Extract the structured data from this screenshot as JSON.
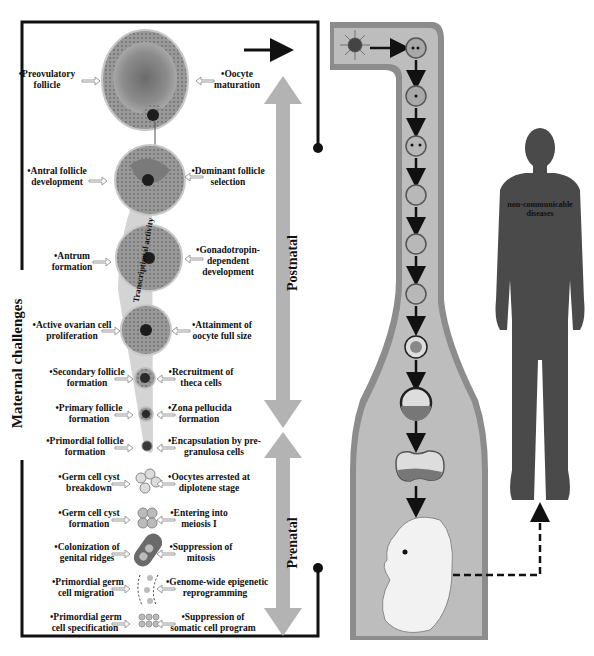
{
  "side_labels": {
    "maternal_challenges": "Maternal challenges",
    "postnatal": "Postnatal",
    "prenatal": "Prenatal",
    "transcriptional_activity": "Transcriptional activity",
    "human_figure_text_line1": "non-communicable",
    "human_figure_text_line2": "diseases"
  },
  "stages": [
    {
      "left_line1": "•Preovulatory",
      "left_line2": "follicle",
      "right_line1": "•Oocyte",
      "right_line2": "maturation",
      "right_line3": ""
    },
    {
      "left_line1": "•Antral follicle",
      "left_line2": "development",
      "right_line1": "•Dominant follicle",
      "right_line2": "selection",
      "right_line3": ""
    },
    {
      "left_line1": "•Antrum",
      "left_line2": "formation",
      "right_line1": "•Gonadotropin-",
      "right_line2": "dependent",
      "right_line3": "development"
    },
    {
      "left_line1": "•Active ovarian cell",
      "left_line2": "proliferation",
      "right_line1": "•Attainment of",
      "right_line2": "oocyte full size",
      "right_line3": ""
    },
    {
      "left_line1": "•Secondary follicle",
      "left_line2": "formation",
      "right_line1": "•Recruitment of",
      "right_line2": "theca cells",
      "right_line3": ""
    },
    {
      "left_line1": "•Primary follicle",
      "left_line2": "formation",
      "right_line1": "•Zona pellucida",
      "right_line2": "formation",
      "right_line3": ""
    },
    {
      "left_line1": "•Primordial follicle",
      "left_line2": "formation",
      "right_line1": "•Encapsulation by pre-",
      "right_line2": "granulosa cells",
      "right_line3": ""
    },
    {
      "left_line1": "•Germ cell cyst",
      "left_line2": "breakdown",
      "right_line1": "•Oocytes arrested at",
      "right_line2": "diplotene stage",
      "right_line3": ""
    },
    {
      "left_line1": "•Germ cell cyst",
      "left_line2": "formation",
      "right_line1": "•Entering into",
      "right_line2": "meiosis I",
      "right_line3": ""
    },
    {
      "left_line1": "•Colonization of",
      "left_line2": "genital ridges",
      "right_line1": "•Suppression of",
      "right_line2": "mitosis",
      "right_line3": ""
    },
    {
      "left_line1": "•Primordial germ",
      "left_line2": "cell migration",
      "right_line1": "•Genome-wide epigenetic",
      "right_line2": "reprogramming",
      "right_line3": ""
    },
    {
      "left_line1": "•Primordial germ",
      "left_line2": "cell specification",
      "right_line1": "•Suppression of",
      "right_line2": "somatic cell program",
      "right_line3": ""
    }
  ],
  "colors": {
    "frame": "#111111",
    "big_arrow": "#b3b3b3",
    "tube_outer": "#8c8c8c",
    "tube_inner": "#bdbdbd",
    "follicle": "#8a8a8a",
    "human": "#4a4a4a",
    "small_arrow": "#c8c8c8"
  }
}
